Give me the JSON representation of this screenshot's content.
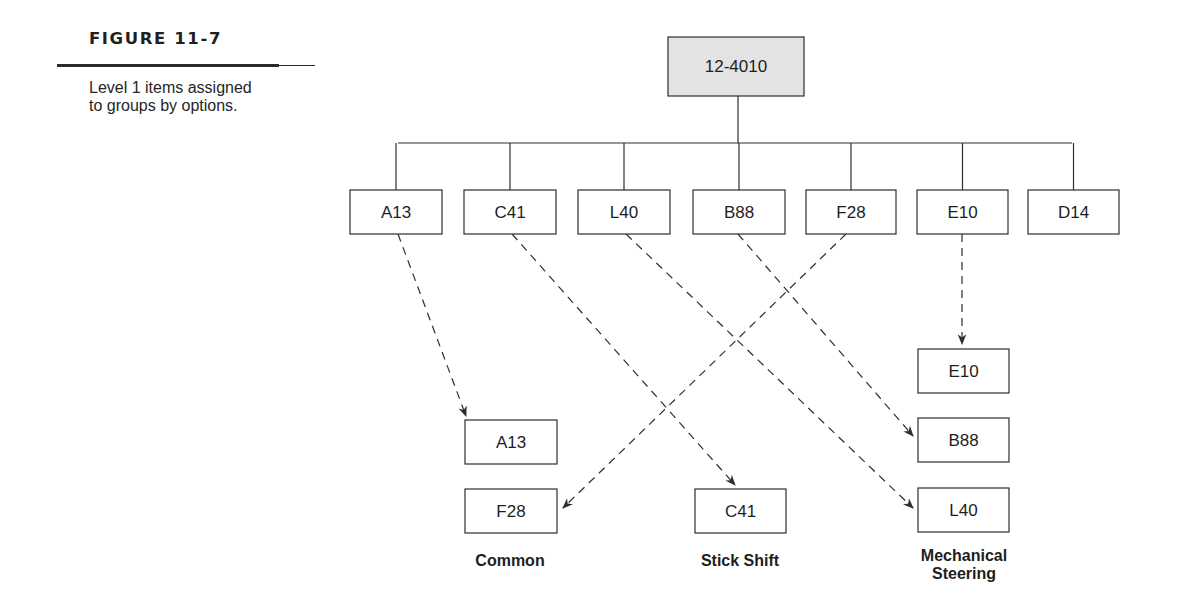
{
  "figure": {
    "number": "FIGURE 11-7",
    "caption": "Level 1 items assigned to groups by options."
  },
  "root": {
    "id": "root",
    "label": "12-4010",
    "x": 668,
    "y": 37,
    "w": 136,
    "h": 59
  },
  "bus": {
    "y": 143,
    "x1": 398,
    "x2": 1072,
    "root_x": 738
  },
  "level1": [
    {
      "id": "A13",
      "label": "A13",
      "x": 350,
      "y": 190,
      "w": 92,
      "h": 44
    },
    {
      "id": "C41",
      "label": "C41",
      "x": 464,
      "y": 190,
      "w": 92,
      "h": 44
    },
    {
      "id": "L40",
      "label": "L40",
      "x": 578,
      "y": 190,
      "w": 92,
      "h": 44
    },
    {
      "id": "B88",
      "label": "B88",
      "x": 693,
      "y": 190,
      "w": 92,
      "h": 44
    },
    {
      "id": "F28",
      "label": "F28",
      "x": 806,
      "y": 190,
      "w": 90,
      "h": 44
    },
    {
      "id": "E10",
      "label": "E10",
      "x": 917,
      "y": 190,
      "w": 91,
      "h": 44
    },
    {
      "id": "D14",
      "label": "D14",
      "x": 1028,
      "y": 190,
      "w": 91,
      "h": 44
    }
  ],
  "groups": [
    {
      "id": "common",
      "label": "Common",
      "label_lines": [
        "Common"
      ],
      "label_x": 510,
      "label_y": 566,
      "items": [
        {
          "id": "A13",
          "label": "A13",
          "x": 465,
          "y": 420,
          "w": 92,
          "h": 44
        },
        {
          "id": "F28",
          "label": "F28",
          "x": 465,
          "y": 489,
          "w": 92,
          "h": 44
        }
      ]
    },
    {
      "id": "stick-shift",
      "label": "Stick Shift",
      "label_lines": [
        "Stick Shift"
      ],
      "label_x": 740,
      "label_y": 566,
      "items": [
        {
          "id": "C41",
          "label": "C41",
          "x": 695,
          "y": 489,
          "w": 91,
          "h": 44
        }
      ]
    },
    {
      "id": "mechanical-steering",
      "label": "Mechanical Steering",
      "label_lines": [
        "Mechanical",
        "Steering"
      ],
      "label_x": 964,
      "label_y": 561,
      "items": [
        {
          "id": "E10",
          "label": "E10",
          "x": 918,
          "y": 349,
          "w": 91,
          "h": 44
        },
        {
          "id": "B88",
          "label": "B88",
          "x": 918,
          "y": 418,
          "w": 91,
          "h": 44
        },
        {
          "id": "L40",
          "label": "L40",
          "x": 918,
          "y": 488,
          "w": 91,
          "h": 44
        }
      ]
    }
  ],
  "arrows": [
    {
      "from": "A13",
      "to": "common.A13",
      "x1": 398,
      "y1": 234,
      "x2": 466,
      "y2": 416
    },
    {
      "from": "C41",
      "to": "stick-shift.C41",
      "x1": 512,
      "y1": 234,
      "x2": 735,
      "y2": 485
    },
    {
      "from": "L40",
      "to": "mechanical-steering.L40",
      "x1": 626,
      "y1": 234,
      "x2": 913,
      "y2": 508
    },
    {
      "from": "B88",
      "to": "mechanical-steering.B88",
      "x1": 738,
      "y1": 234,
      "x2": 913,
      "y2": 436
    },
    {
      "from": "F28",
      "to": "common.F28",
      "x1": 846,
      "y1": 234,
      "x2": 563,
      "y2": 508
    },
    {
      "from": "E10",
      "to": "mechanical-steering.E10",
      "x1": 962,
      "y1": 234,
      "x2": 962,
      "y2": 344
    }
  ],
  "colors": {
    "stroke": "#2e2e2e",
    "root_fill": "#e3e3e3",
    "text": "#1e1e1e"
  }
}
